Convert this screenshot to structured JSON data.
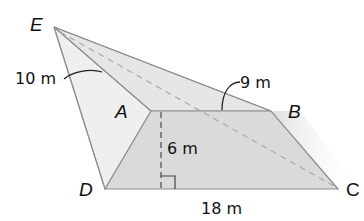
{
  "diagram": {
    "type": "pyramid-on-trapezoid-base",
    "vertices": {
      "E": {
        "label": "E",
        "x": 54,
        "y": 27
      },
      "A": {
        "label": "A",
        "x": 151,
        "y": 111
      },
      "B": {
        "label": "B",
        "x": 271,
        "y": 111
      },
      "C": {
        "label": "C",
        "x": 338,
        "y": 189
      },
      "D": {
        "label": "D",
        "x": 105,
        "y": 189
      }
    },
    "measurements": {
      "ea": "10 m",
      "eb": "9 m",
      "height": "6 m",
      "dc": "18 m"
    },
    "colors": {
      "base_fill": "#dcdcdc",
      "left_face_fill": "#efefef",
      "top_face_fill": "#e4e4e4",
      "edge": "#8c8c8c",
      "dashed": "#a8a8a8",
      "leader": "#222222"
    }
  }
}
